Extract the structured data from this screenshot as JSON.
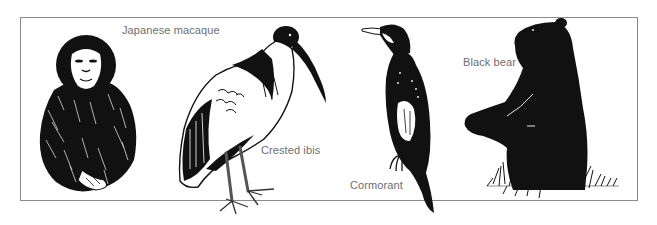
{
  "figure": {
    "animals": [
      {
        "id": "macaque",
        "label": "Japanese macaque"
      },
      {
        "id": "ibis",
        "label": "Crested ibis"
      },
      {
        "id": "cormorant",
        "label": "Cormorant"
      },
      {
        "id": "bear",
        "label": "Black bear"
      }
    ]
  },
  "colors": {
    "ink": "#111111",
    "frame": "#8a8a8a",
    "label": "#6e6e6e",
    "background": "#ffffff"
  }
}
